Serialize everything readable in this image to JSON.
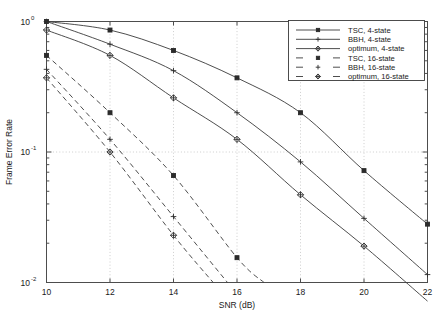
{
  "chart_data": {
    "type": "line",
    "title": "",
    "xlabel": "SNR (dB)",
    "ylabel": "Frame Error Rate",
    "xlim": [
      10,
      22
    ],
    "ylim": [
      0.01,
      1.0
    ],
    "yscale": "log",
    "xticks": [
      10,
      12,
      14,
      16,
      18,
      20,
      22
    ],
    "xticklabels": [
      "10",
      "12",
      "14",
      "16",
      "18",
      "20",
      "22"
    ],
    "yticks": [
      1,
      0.1,
      0.01
    ],
    "yticklabels": [
      "10^0",
      "10^-1",
      "10^-2"
    ],
    "ytick_mantissa": "10",
    "ytick_exponents": [
      "0",
      "-1",
      "-2"
    ],
    "grid": true,
    "legend_position": "upper right",
    "series": [
      {
        "name": "TSC, 4-state",
        "style": "solid",
        "marker": "square",
        "x": [
          10,
          12,
          14,
          16,
          18,
          20,
          22
        ],
        "values": [
          1.0,
          0.86,
          0.6,
          0.37,
          0.2,
          0.072,
          0.028
        ]
      },
      {
        "name": "BBH, 4-state",
        "style": "solid",
        "marker": "plus",
        "x": [
          10,
          12,
          14,
          16,
          18,
          20,
          22
        ],
        "values": [
          1.0,
          0.67,
          0.42,
          0.2,
          0.084,
          0.031,
          0.0115
        ]
      },
      {
        "name": "optimum, 4-state",
        "style": "solid",
        "marker": "diamond",
        "x": [
          10,
          12,
          14,
          16,
          18,
          20,
          22
        ],
        "values": [
          0.86,
          0.55,
          0.26,
          0.125,
          0.047,
          0.019,
          0.0072
        ]
      },
      {
        "name": "TSC, 16-state",
        "style": "dashed",
        "marker": "square",
        "x": [
          10,
          12,
          14,
          16,
          16.85
        ],
        "values": [
          0.55,
          0.2,
          0.066,
          0.0155,
          0.01
        ]
      },
      {
        "name": "BBH, 16-state",
        "style": "dashed",
        "marker": "plus",
        "x": [
          10,
          12,
          14,
          15.7
        ],
        "values": [
          0.43,
          0.125,
          0.032,
          0.01
        ]
      },
      {
        "name": "optimum, 16-state",
        "style": "dashed",
        "marker": "diamond",
        "x": [
          10,
          12,
          14,
          15.25
        ],
        "values": [
          0.37,
          0.1,
          0.023,
          0.01
        ]
      }
    ],
    "legend_entries": [
      {
        "label": "TSC, 4-state",
        "style": "solid",
        "marker": "square"
      },
      {
        "label": "BBH, 4-state",
        "style": "solid",
        "marker": "plus"
      },
      {
        "label": "optimum, 4-state",
        "style": "solid",
        "marker": "diamond"
      },
      {
        "label": "TSC, 16-state",
        "style": "dashed",
        "marker": "square"
      },
      {
        "label": "BBH, 16-state",
        "style": "dashed",
        "marker": "plus"
      },
      {
        "label": "optimum, 16-state",
        "style": "dashed",
        "marker": "diamond"
      }
    ]
  }
}
